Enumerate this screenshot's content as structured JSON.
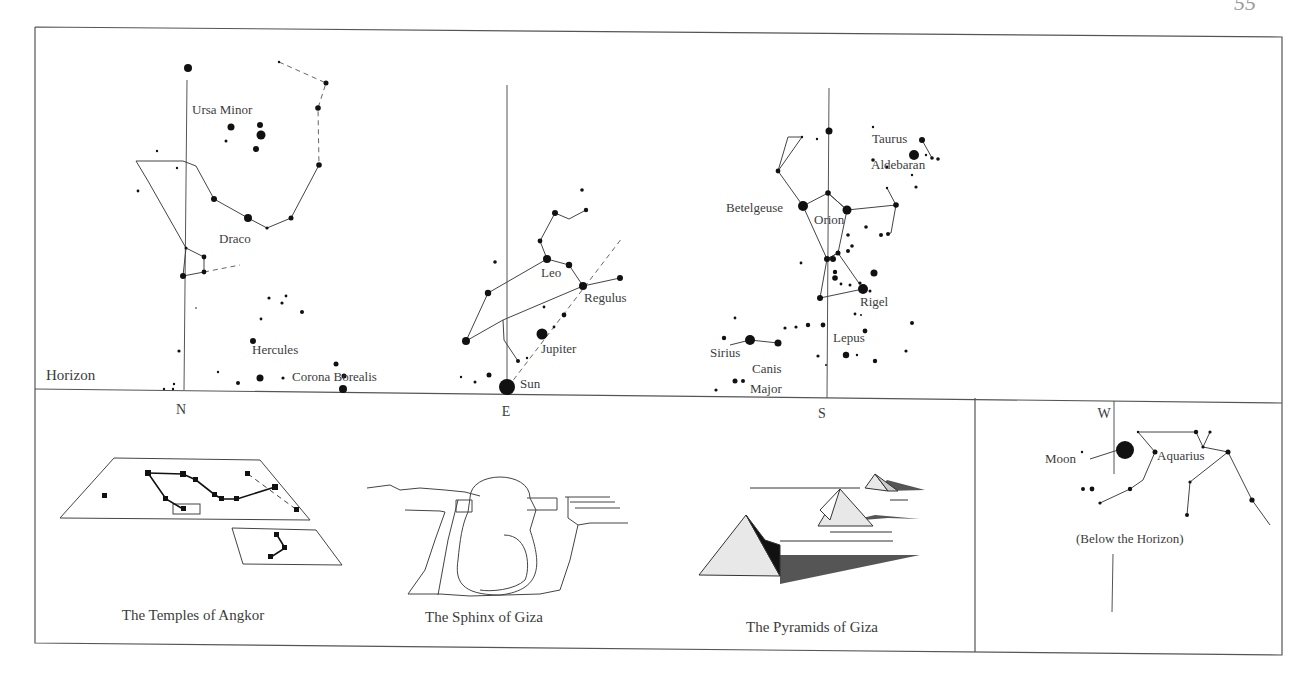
{
  "page_number": "55",
  "colors": {
    "ink": "#1a1a1a",
    "line": "#555555",
    "text": "#3c3c3c",
    "shadow": "#4a4a4a",
    "pyramid_face": "#e8e8e8"
  },
  "sky": {
    "horizon_label": "Horizon",
    "directions": [
      {
        "label": "N",
        "x": 181,
        "y": 414
      },
      {
        "label": "E",
        "x": 506,
        "y": 416
      },
      {
        "label": "S",
        "x": 822,
        "y": 418
      },
      {
        "label": "W",
        "x": 1104,
        "y": 418
      }
    ],
    "labels": [
      {
        "text": "Ursa Minor",
        "x": 192,
        "y": 114
      },
      {
        "text": "Draco",
        "x": 219,
        "y": 243
      },
      {
        "text": "Hercules",
        "x": 252,
        "y": 354
      },
      {
        "text": "Corona Borealis",
        "x": 292,
        "y": 381
      },
      {
        "text": "Leo",
        "x": 541,
        "y": 277
      },
      {
        "text": "Regulus",
        "x": 584,
        "y": 302
      },
      {
        "text": "Jupiter",
        "x": 541,
        "y": 353
      },
      {
        "text": "Sun",
        "x": 520,
        "y": 388
      },
      {
        "text": "Taurus",
        "x": 872,
        "y": 143
      },
      {
        "text": "Aldebaran",
        "x": 871,
        "y": 169
      },
      {
        "text": "Betelgeuse",
        "x": 726,
        "y": 212
      },
      {
        "text": "Orion",
        "x": 814,
        "y": 224
      },
      {
        "text": "Rigel",
        "x": 860,
        "y": 306
      },
      {
        "text": "Lepus",
        "x": 833,
        "y": 342
      },
      {
        "text": "Sirius",
        "x": 710,
        "y": 357
      },
      {
        "text": "Canis",
        "x": 752,
        "y": 373
      },
      {
        "text": "Major",
        "x": 750,
        "y": 393
      },
      {
        "text": "Moon",
        "x": 1045,
        "y": 463
      },
      {
        "text": "Aquarius",
        "x": 1157,
        "y": 460
      },
      {
        "text": "(Below the Horizon)",
        "x": 1076,
        "y": 543
      }
    ],
    "stars": [
      [
        188,
        68,
        4
      ],
      [
        231,
        127,
        3.5
      ],
      [
        260,
        125,
        3
      ],
      [
        261,
        135,
        4.5
      ],
      [
        226,
        141,
        1.5
      ],
      [
        256,
        149,
        3
      ],
      [
        157,
        151,
        1.2
      ],
      [
        177,
        168,
        1.2
      ],
      [
        138,
        191,
        1.4
      ],
      [
        214,
        199,
        3
      ],
      [
        248,
        218,
        4
      ],
      [
        291,
        218,
        2.5
      ],
      [
        267,
        228,
        1.6
      ],
      [
        319,
        165,
        2.8
      ],
      [
        318,
        108,
        2.8
      ],
      [
        326,
        83,
        2.5
      ],
      [
        279,
        62,
        1.2
      ],
      [
        186,
        248,
        1.5
      ],
      [
        204,
        257,
        2.4
      ],
      [
        204,
        272,
        2.4
      ],
      [
        183,
        276,
        3
      ],
      [
        269,
        298,
        1.6
      ],
      [
        286,
        296,
        1.4
      ],
      [
        282,
        303,
        1.6
      ],
      [
        302,
        312,
        2
      ],
      [
        261,
        319,
        1.4
      ],
      [
        196,
        308,
        0.8
      ],
      [
        253,
        341,
        3
      ],
      [
        179,
        351,
        1.6
      ],
      [
        218,
        372,
        1.2
      ],
      [
        260,
        378,
        3.5
      ],
      [
        238,
        383,
        2
      ],
      [
        283,
        378,
        1.6
      ],
      [
        336,
        364,
        2.5
      ],
      [
        344,
        376,
        2.5
      ],
      [
        343,
        389,
        4
      ],
      [
        164,
        389,
        1.2
      ],
      [
        174,
        384,
        1.2
      ],
      [
        173,
        389,
        1.2
      ],
      [
        582,
        190,
        1.8
      ],
      [
        586,
        210,
        2.2
      ],
      [
        555,
        213,
        3
      ],
      [
        540,
        241,
        2.4
      ],
      [
        547,
        259,
        4
      ],
      [
        569,
        265,
        3.2
      ],
      [
        583,
        286,
        4
      ],
      [
        620,
        278,
        3
      ],
      [
        495,
        262,
        1.8
      ],
      [
        488,
        293,
        3.2
      ],
      [
        466,
        341,
        4
      ],
      [
        544,
        307,
        1.4
      ],
      [
        564,
        315,
        2.4
      ],
      [
        554,
        327,
        1.4
      ],
      [
        542,
        334,
        5.5
      ],
      [
        518,
        361,
        2
      ],
      [
        527,
        358,
        1.2
      ],
      [
        489,
        375,
        2.5
      ],
      [
        475,
        382,
        1.5
      ],
      [
        461,
        377,
        1.2
      ],
      [
        507,
        387,
        8
      ],
      [
        829,
        131,
        3.5
      ],
      [
        817,
        139,
        1.2
      ],
      [
        802,
        137,
        1.2
      ],
      [
        778,
        171,
        2.4
      ],
      [
        828,
        193,
        2.8
      ],
      [
        803,
        206,
        5
      ],
      [
        847,
        210,
        4.5
      ],
      [
        873,
        127,
        1.2
      ],
      [
        922,
        140,
        3
      ],
      [
        914,
        155,
        5
      ],
      [
        932,
        158,
        1.8
      ],
      [
        938,
        159,
        1.8
      ],
      [
        873,
        160,
        1.8
      ],
      [
        926,
        155,
        1.2
      ],
      [
        887,
        167,
        1.4
      ],
      [
        912,
        175,
        1.2
      ],
      [
        916,
        187,
        1.6
      ],
      [
        887,
        188,
        1.2
      ],
      [
        896,
        205,
        2.8
      ],
      [
        866,
        227,
        1.8
      ],
      [
        881,
        235,
        2
      ],
      [
        888,
        234,
        2
      ],
      [
        848,
        235,
        1.8
      ],
      [
        852,
        246,
        1.8
      ],
      [
        848,
        251,
        2
      ],
      [
        838,
        253,
        2.5
      ],
      [
        833,
        259,
        3
      ],
      [
        827,
        259,
        3
      ],
      [
        801,
        263,
        1.4
      ],
      [
        835,
        272,
        2.2
      ],
      [
        835,
        278,
        2.8
      ],
      [
        874,
        273,
        3.5
      ],
      [
        841,
        284,
        1.4
      ],
      [
        850,
        285,
        1.5
      ],
      [
        860,
        283,
        1.6
      ],
      [
        863,
        289,
        5
      ],
      [
        870,
        291,
        1.5
      ],
      [
        820,
        298,
        3
      ],
      [
        855,
        314,
        1.4
      ],
      [
        861,
        315,
        1
      ],
      [
        735,
        318,
        1.4
      ],
      [
        785,
        328,
        1.6
      ],
      [
        808,
        325,
        2.2
      ],
      [
        796,
        327,
        1.6
      ],
      [
        823,
        325,
        2.4
      ],
      [
        865,
        331,
        2.4
      ],
      [
        912,
        323,
        2
      ],
      [
        724,
        338,
        2.2
      ],
      [
        750,
        340,
        5
      ],
      [
        778,
        343,
        3.5
      ],
      [
        906,
        351,
        1.6
      ],
      [
        818,
        356,
        1.6
      ],
      [
        846,
        355,
        3.2
      ],
      [
        857,
        355,
        1.2
      ],
      [
        875,
        361,
        2.2
      ],
      [
        826,
        365,
        1
      ],
      [
        735,
        381,
        2.5
      ],
      [
        743,
        381,
        2
      ],
      [
        716,
        390,
        1.6
      ],
      [
        1082,
        452,
        1.2
      ],
      [
        1125,
        450,
        9
      ],
      [
        1138,
        432,
        1.2
      ],
      [
        1196,
        432,
        2.2
      ],
      [
        1210,
        432,
        1.6
      ],
      [
        1203,
        447,
        1.6
      ],
      [
        1155,
        452,
        2.5
      ],
      [
        1228,
        452,
        2.5
      ],
      [
        1130,
        489,
        2.2
      ],
      [
        1083,
        489,
        2
      ],
      [
        1092,
        489,
        2.4
      ],
      [
        1100,
        503,
        1.6
      ],
      [
        1190,
        482,
        1.6
      ],
      [
        1252,
        500,
        2.6
      ],
      [
        1187,
        515,
        2
      ]
    ],
    "lines": [
      [
        [
          136,
          161
        ],
        [
          183,
          161
        ],
        [
          196,
          166
        ],
        [
          214,
          199
        ],
        [
          248,
          218
        ],
        [
          267,
          228
        ],
        [
          291,
          218
        ],
        [
          319,
          165
        ]
      ],
      [
        [
          136,
          161
        ],
        [
          148,
          181
        ],
        [
          186,
          248
        ],
        [
          204,
          257
        ],
        [
          204,
          272
        ],
        [
          183,
          276
        ],
        [
          186,
          248
        ]
      ],
      [
        [
          547,
          259
        ],
        [
          569,
          265
        ],
        [
          583,
          286
        ]
      ],
      [
        [
          547,
          259
        ],
        [
          540,
          241
        ],
        [
          555,
          213
        ],
        [
          569,
          219
        ],
        [
          586,
          210
        ]
      ],
      [
        [
          547,
          259
        ],
        [
          488,
          293
        ],
        [
          466,
          341
        ],
        [
          503,
          320
        ],
        [
          583,
          286
        ],
        [
          620,
          278
        ]
      ],
      [
        [
          503,
          320
        ],
        [
          504,
          340
        ],
        [
          518,
          361
        ]
      ],
      [
        [
          778,
          171
        ],
        [
          788,
          137
        ],
        [
          802,
          137
        ],
        [
          778,
          171
        ],
        [
          803,
          206
        ],
        [
          828,
          193
        ],
        [
          847,
          210
        ],
        [
          896,
          205
        ],
        [
          891,
          233
        ],
        [
          887,
          234
        ]
      ],
      [
        [
          828,
          193
        ],
        [
          847,
          210
        ],
        [
          838,
          253
        ],
        [
          827,
          259
        ],
        [
          803,
          206
        ]
      ],
      [
        [
          827,
          259
        ],
        [
          820,
          298
        ],
        [
          863,
          289
        ],
        [
          838,
          253
        ],
        [
          827,
          259
        ]
      ],
      [
        [
          887,
          188
        ],
        [
          896,
          205
        ]
      ],
      [
        [
          922,
          140
        ],
        [
          932,
          158
        ]
      ],
      [
        [
          730,
          345
        ],
        [
          750,
          340
        ],
        [
          778,
          343
        ]
      ],
      [
        [
          1138,
          432
        ],
        [
          1196,
          432
        ],
        [
          1203,
          447
        ],
        [
          1228,
          452
        ],
        [
          1252,
          500
        ],
        [
          1270,
          525
        ]
      ],
      [
        [
          1138,
          432
        ],
        [
          1155,
          452
        ],
        [
          1143,
          480
        ],
        [
          1130,
          489
        ],
        [
          1100,
          503
        ]
      ],
      [
        [
          1228,
          452
        ],
        [
          1190,
          482
        ],
        [
          1187,
          515
        ]
      ],
      [
        [
          1210,
          432
        ],
        [
          1203,
          447
        ]
      ],
      [
        [
          1090,
          459
        ],
        [
          1118,
          450
        ]
      ]
    ],
    "dashed": [
      [
        [
          279,
          62
        ],
        [
          326,
          83
        ],
        [
          318,
          108
        ],
        [
          319,
          165
        ]
      ],
      [
        [
          204,
          272
        ],
        [
          240,
          265
        ]
      ],
      [
        [
          508,
          387
        ],
        [
          622,
          238
        ]
      ]
    ],
    "meridians": [
      [
        [
          187,
          80
        ],
        [
          184,
          390
        ]
      ],
      [
        [
          507,
          85
        ],
        [
          507,
          387
        ]
      ],
      [
        [
          829,
          88
        ],
        [
          827,
          398
        ]
      ],
      [
        [
          1114,
          401
        ],
        [
          1114,
          474
        ]
      ],
      [
        [
          1113,
          554
        ],
        [
          1112,
          612
        ]
      ]
    ]
  },
  "panels": [
    {
      "caption": "The Temples of Angkor",
      "x": 193,
      "y": 620
    },
    {
      "caption": "The Sphinx of Giza",
      "x": 484,
      "y": 622
    },
    {
      "caption": "The Pyramids of Giza",
      "x": 812,
      "y": 632
    }
  ]
}
